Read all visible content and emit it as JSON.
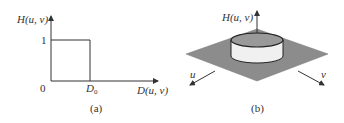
{
  "panels": [
    {
      "id": "a",
      "caption": "(a)",
      "y_axis_label": "H(u, v)",
      "x_axis_label": "D(u, v)",
      "origin_label": "0",
      "y_tick_label": "1",
      "x_tick_label": "D",
      "x_tick_subscript": "0",
      "description": "Ideal lowpass filter transfer function cross-section: H = 1 for D <= D0, 0 otherwise"
    },
    {
      "id": "b",
      "caption": "(b)",
      "vertical_axis_label": "H(u, v)",
      "u_axis_label": "u",
      "v_axis_label": "v",
      "description": "3D perspective plot: cylinder on gray plane"
    }
  ],
  "colors": {
    "line": "#333333",
    "plane": "#8c8c8c",
    "cylinder_top": "#999999",
    "cylinder_side": "#f0f0f0"
  }
}
